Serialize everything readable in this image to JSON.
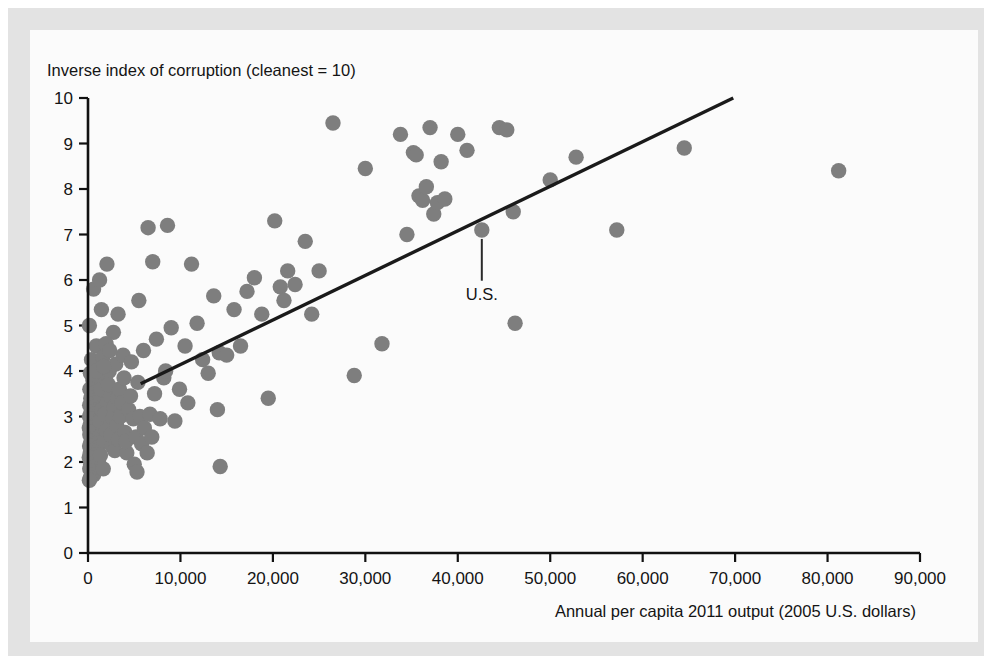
{
  "figure": {
    "background_color": "#fbfbfb",
    "frame_color": "#e3e3e3"
  },
  "chart_data": {
    "type": "scatter",
    "title": "",
    "ylabel": "Inverse index of corruption (cleanest = 10)",
    "xlabel": "Annual per capita 2011 output (2005 U.S. dollars)",
    "xlim": [
      0,
      90000
    ],
    "ylim": [
      0,
      10
    ],
    "grid": false,
    "legend": null,
    "xticks": [
      0,
      10000,
      20000,
      30000,
      40000,
      50000,
      60000,
      70000,
      80000,
      90000
    ],
    "xtick_labels": [
      "0",
      "10,000",
      "20,000",
      "30,000",
      "40,000",
      "50,000",
      "60,000",
      "70,000",
      "80,000",
      "90,000"
    ],
    "yticks": [
      0,
      1,
      2,
      3,
      4,
      5,
      6,
      7,
      8,
      9,
      10
    ],
    "ytick_labels": [
      "0",
      "1",
      "2",
      "3",
      "4",
      "5",
      "6",
      "7",
      "8",
      "9",
      "10"
    ],
    "marker_color": "#7e7e7e",
    "marker_size": 9,
    "trendline": {
      "label": "fitted regression line",
      "color": "#1a1a1a",
      "x_start": 5700,
      "y_start": 3.72,
      "x_end": 69800,
      "y_end": 10.0
    },
    "annotations": [
      {
        "text": "U.S.",
        "point_x": 42600,
        "point_y": 7.1,
        "label_x": 42600,
        "label_y": 6.05
      }
    ],
    "points": [
      {
        "x": 150,
        "y": 5.0
      },
      {
        "x": 600,
        "y": 5.8
      },
      {
        "x": 900,
        "y": 4.55
      },
      {
        "x": 380,
        "y": 4.25
      },
      {
        "x": 260,
        "y": 3.95
      },
      {
        "x": 520,
        "y": 3.8
      },
      {
        "x": 200,
        "y": 3.6
      },
      {
        "x": 700,
        "y": 3.52
      },
      {
        "x": 1100,
        "y": 3.45
      },
      {
        "x": 300,
        "y": 3.4
      },
      {
        "x": 450,
        "y": 3.35
      },
      {
        "x": 820,
        "y": 3.3
      },
      {
        "x": 180,
        "y": 3.25
      },
      {
        "x": 600,
        "y": 3.2
      },
      {
        "x": 950,
        "y": 3.15
      },
      {
        "x": 330,
        "y": 3.1
      },
      {
        "x": 740,
        "y": 3.05
      },
      {
        "x": 160,
        "y": 3.0
      },
      {
        "x": 480,
        "y": 2.95
      },
      {
        "x": 1050,
        "y": 2.9
      },
      {
        "x": 270,
        "y": 2.85
      },
      {
        "x": 640,
        "y": 2.8
      },
      {
        "x": 140,
        "y": 2.75
      },
      {
        "x": 870,
        "y": 2.7
      },
      {
        "x": 400,
        "y": 2.65
      },
      {
        "x": 200,
        "y": 2.6
      },
      {
        "x": 1200,
        "y": 2.55
      },
      {
        "x": 560,
        "y": 2.5
      },
      {
        "x": 310,
        "y": 2.45
      },
      {
        "x": 760,
        "y": 2.4
      },
      {
        "x": 170,
        "y": 2.35
      },
      {
        "x": 980,
        "y": 2.3
      },
      {
        "x": 430,
        "y": 2.25
      },
      {
        "x": 240,
        "y": 2.2
      },
      {
        "x": 660,
        "y": 2.15
      },
      {
        "x": 130,
        "y": 2.1
      },
      {
        "x": 1150,
        "y": 2.05
      },
      {
        "x": 520,
        "y": 2.0
      },
      {
        "x": 290,
        "y": 1.95
      },
      {
        "x": 800,
        "y": 1.9
      },
      {
        "x": 190,
        "y": 1.85
      },
      {
        "x": 380,
        "y": 1.8
      },
      {
        "x": 610,
        "y": 1.72
      },
      {
        "x": 250,
        "y": 1.65
      },
      {
        "x": 150,
        "y": 1.6
      },
      {
        "x": 1400,
        "y": 3.6
      },
      {
        "x": 1600,
        "y": 4.3
      },
      {
        "x": 1300,
        "y": 2.9
      },
      {
        "x": 1750,
        "y": 2.45
      },
      {
        "x": 1500,
        "y": 3.15
      },
      {
        "x": 1900,
        "y": 3.85
      },
      {
        "x": 1350,
        "y": 2.15
      },
      {
        "x": 2100,
        "y": 3.3
      },
      {
        "x": 1650,
        "y": 1.85
      },
      {
        "x": 2300,
        "y": 4.0
      },
      {
        "x": 2000,
        "y": 2.7
      },
      {
        "x": 2450,
        "y": 3.45
      },
      {
        "x": 1800,
        "y": 3.05
      },
      {
        "x": 2600,
        "y": 2.35
      },
      {
        "x": 2200,
        "y": 3.7
      },
      {
        "x": 2800,
        "y": 3.2
      },
      {
        "x": 2500,
        "y": 2.6
      },
      {
        "x": 3000,
        "y": 4.15
      },
      {
        "x": 2700,
        "y": 2.95
      },
      {
        "x": 3200,
        "y": 3.4
      },
      {
        "x": 2900,
        "y": 2.25
      },
      {
        "x": 3400,
        "y": 3.6
      },
      {
        "x": 3100,
        "y": 2.8
      },
      {
        "x": 3600,
        "y": 3.1
      },
      {
        "x": 3300,
        "y": 2.5
      },
      {
        "x": 3800,
        "y": 4.35
      },
      {
        "x": 3500,
        "y": 3.0
      },
      {
        "x": 4000,
        "y": 2.65
      },
      {
        "x": 3700,
        "y": 3.3
      },
      {
        "x": 4200,
        "y": 2.2
      },
      {
        "x": 3900,
        "y": 3.85
      },
      {
        "x": 4400,
        "y": 3.15
      },
      {
        "x": 4100,
        "y": 2.45
      },
      {
        "x": 1250,
        "y": 6.0
      },
      {
        "x": 2050,
        "y": 6.35
      },
      {
        "x": 1450,
        "y": 5.35
      },
      {
        "x": 2750,
        "y": 4.85
      },
      {
        "x": 1950,
        "y": 4.6
      },
      {
        "x": 3250,
        "y": 5.25
      },
      {
        "x": 2350,
        "y": 4.45
      },
      {
        "x": 900,
        "y": 4.0
      },
      {
        "x": 1700,
        "y": 4.1
      },
      {
        "x": 4600,
        "y": 3.45
      },
      {
        "x": 4900,
        "y": 2.95
      },
      {
        "x": 5200,
        "y": 2.55
      },
      {
        "x": 4700,
        "y": 4.2
      },
      {
        "x": 5400,
        "y": 3.75
      },
      {
        "x": 5000,
        "y": 1.95
      },
      {
        "x": 5600,
        "y": 3.0
      },
      {
        "x": 5800,
        "y": 2.4
      },
      {
        "x": 6100,
        "y": 2.75
      },
      {
        "x": 5300,
        "y": 1.78
      },
      {
        "x": 6400,
        "y": 2.2
      },
      {
        "x": 6700,
        "y": 3.05
      },
      {
        "x": 6000,
        "y": 4.45
      },
      {
        "x": 6900,
        "y": 2.55
      },
      {
        "x": 7200,
        "y": 3.5
      },
      {
        "x": 6500,
        "y": 7.15
      },
      {
        "x": 7000,
        "y": 6.4
      },
      {
        "x": 5500,
        "y": 5.55
      },
      {
        "x": 7400,
        "y": 4.7
      },
      {
        "x": 7800,
        "y": 2.95
      },
      {
        "x": 8200,
        "y": 3.85
      },
      {
        "x": 8600,
        "y": 7.2
      },
      {
        "x": 9000,
        "y": 4.95
      },
      {
        "x": 8400,
        "y": 4.0
      },
      {
        "x": 9400,
        "y": 2.9
      },
      {
        "x": 9900,
        "y": 3.6
      },
      {
        "x": 10500,
        "y": 4.55
      },
      {
        "x": 11200,
        "y": 6.35
      },
      {
        "x": 10800,
        "y": 3.3
      },
      {
        "x": 11800,
        "y": 5.05
      },
      {
        "x": 12400,
        "y": 4.25
      },
      {
        "x": 13000,
        "y": 3.95
      },
      {
        "x": 13600,
        "y": 5.65
      },
      {
        "x": 14200,
        "y": 4.4
      },
      {
        "x": 14000,
        "y": 3.15
      },
      {
        "x": 14300,
        "y": 1.9
      },
      {
        "x": 15000,
        "y": 4.35
      },
      {
        "x": 15800,
        "y": 5.35
      },
      {
        "x": 16500,
        "y": 4.55
      },
      {
        "x": 17200,
        "y": 5.75
      },
      {
        "x": 18000,
        "y": 6.05
      },
      {
        "x": 18800,
        "y": 5.25
      },
      {
        "x": 19500,
        "y": 3.4
      },
      {
        "x": 20200,
        "y": 7.3
      },
      {
        "x": 20800,
        "y": 5.85
      },
      {
        "x": 21200,
        "y": 5.55
      },
      {
        "x": 21600,
        "y": 6.2
      },
      {
        "x": 22400,
        "y": 5.9
      },
      {
        "x": 23500,
        "y": 6.85
      },
      {
        "x": 24200,
        "y": 5.25
      },
      {
        "x": 25000,
        "y": 6.2
      },
      {
        "x": 26500,
        "y": 9.45
      },
      {
        "x": 28800,
        "y": 3.9
      },
      {
        "x": 30000,
        "y": 8.45
      },
      {
        "x": 31800,
        "y": 4.6
      },
      {
        "x": 33800,
        "y": 9.2
      },
      {
        "x": 34500,
        "y": 7.0
      },
      {
        "x": 35200,
        "y": 8.8
      },
      {
        "x": 35500,
        "y": 8.75
      },
      {
        "x": 35800,
        "y": 7.85
      },
      {
        "x": 36200,
        "y": 7.75
      },
      {
        "x": 36600,
        "y": 8.05
      },
      {
        "x": 37000,
        "y": 9.35
      },
      {
        "x": 37400,
        "y": 7.45
      },
      {
        "x": 37800,
        "y": 7.7
      },
      {
        "x": 38200,
        "y": 8.6
      },
      {
        "x": 38600,
        "y": 7.78
      },
      {
        "x": 40000,
        "y": 9.2
      },
      {
        "x": 41000,
        "y": 8.85
      },
      {
        "x": 42600,
        "y": 7.1
      },
      {
        "x": 44500,
        "y": 9.35
      },
      {
        "x": 45300,
        "y": 9.3
      },
      {
        "x": 46000,
        "y": 7.5
      },
      {
        "x": 46200,
        "y": 5.05
      },
      {
        "x": 50000,
        "y": 8.2
      },
      {
        "x": 52800,
        "y": 8.7
      },
      {
        "x": 57200,
        "y": 7.1
      },
      {
        "x": 64500,
        "y": 8.9
      },
      {
        "x": 81200,
        "y": 8.4
      }
    ]
  }
}
